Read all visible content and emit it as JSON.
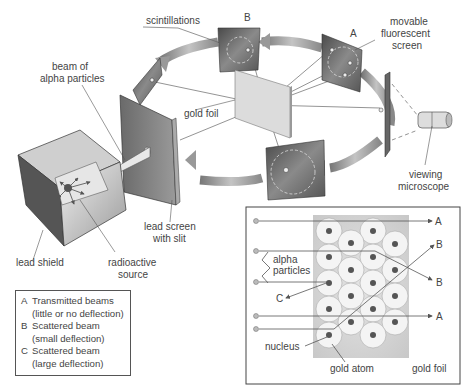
{
  "diagram": {
    "labels": {
      "scintillations": "scintillations",
      "screen_b": "B",
      "screen_a": "A",
      "movable_screen_line1": "movable",
      "movable_screen_line2": "fluorescent",
      "movable_screen_line3": "screen",
      "beam_line1": "beam of",
      "beam_line2": "alpha particles",
      "gold_foil": "gold foil",
      "viewing_line1": "viewing",
      "viewing_line2": "microscope",
      "lead_screen_line1": "lead screen",
      "lead_screen_line2": "with slit",
      "lead_shield": "lead shield",
      "radioactive_line1": "radioactive",
      "radioactive_line2": "source"
    },
    "legend": [
      {
        "key": "A",
        "line1": "Transmitted beams",
        "line2": "(little or no deflection)"
      },
      {
        "key": "B",
        "line1": "Scattered beam",
        "line2": "(small deflection)"
      },
      {
        "key": "C",
        "line1": "Scattered beam",
        "line2": "(large deflection)"
      }
    ],
    "inset": {
      "alpha_line1": "alpha",
      "alpha_line2": "particles",
      "nucleus": "nucleus",
      "gold_atom": "gold atom",
      "gold_foil": "gold foil",
      "out_A_top": "A",
      "out_B_top": "B",
      "out_B_mid": "B",
      "out_C": "C",
      "out_A_bottom": "A"
    },
    "colors": {
      "screen_dark": "#5a5a5a",
      "arrow_gray": "#8a8a8a",
      "foil_light": "#d9d9d9",
      "atom_fill": "#f2f2f2",
      "nucleus": "#555555",
      "inset_bg": "#cfcfcf"
    }
  }
}
